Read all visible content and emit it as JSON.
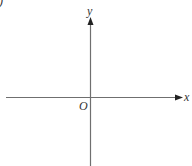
{
  "diagram": {
    "type": "coordinate-axes",
    "corner_mark": ")",
    "x_axis_label": "x",
    "y_axis_label": "y",
    "origin_label": "O",
    "colors": {
      "axis": "#6f6f6f",
      "arrow": "#222222",
      "text": "#333333",
      "background": "#ffffff"
    }
  }
}
